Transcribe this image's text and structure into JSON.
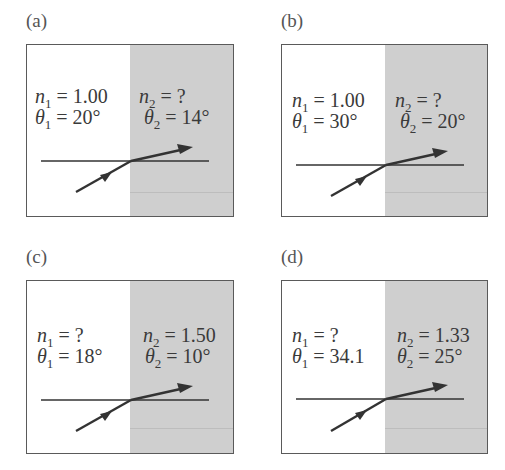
{
  "figure": {
    "panels": [
      {
        "label": "(a)",
        "n1_sym": "n",
        "n1_sub": "1",
        "n1_val": "= 1.00",
        "t1_sym": "θ",
        "t1_sub": "1",
        "t1_val": "= 20°",
        "n2_sym": "n",
        "n2_sub": "2",
        "n2_val": "= ?",
        "t2_sym": "θ",
        "t2_sub": "2",
        "t2_val": "= 14°"
      },
      {
        "label": "(b)",
        "n1_sym": "n",
        "n1_sub": "1",
        "n1_val": "= 1.00",
        "t1_sym": "θ",
        "t1_sub": "1",
        "t1_val": "= 30°",
        "n2_sym": "n",
        "n2_sub": "2",
        "n2_val": "= ?",
        "t2_sym": "θ",
        "t2_sub": "2",
        "t2_val": "= 20°"
      },
      {
        "label": "(c)",
        "n1_sym": "n",
        "n1_sub": "1",
        "n1_val": "= ?",
        "t1_sym": "θ",
        "t1_sub": "1",
        "t1_val": "= 18°",
        "n2_sym": "n",
        "n2_sub": "2",
        "n2_val": "= 1.50",
        "t2_sym": "θ",
        "t2_sub": "2",
        "t2_val": "= 10°"
      },
      {
        "label": "(d)",
        "n1_sym": "n",
        "n1_sub": "1",
        "n1_val": "= ?",
        "t1_sym": "θ",
        "t1_sub": "1",
        "t1_val": "= 34.1",
        "n2_sym": "n",
        "n2_sub": "2",
        "n2_val": "= 1.33",
        "t2_sym": "θ",
        "t2_sub": "2",
        "t2_val": "= 25°"
      }
    ],
    "colors": {
      "medium2_fill": "#cfcfcf",
      "ray": "#333333",
      "border": "#5a5a5a"
    }
  }
}
